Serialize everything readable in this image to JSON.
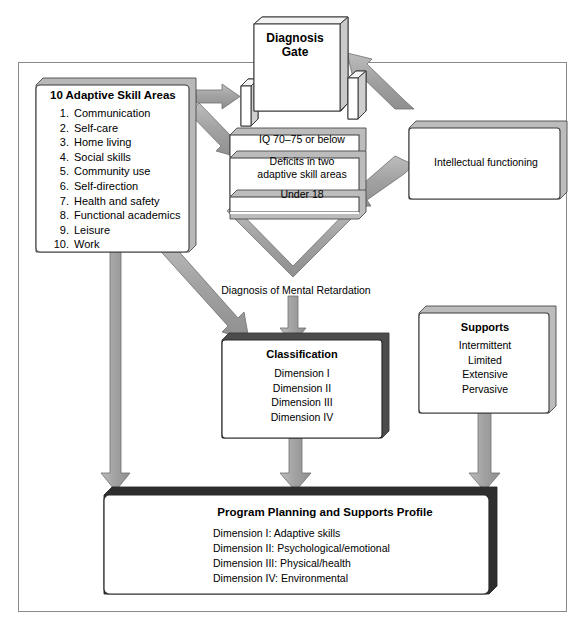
{
  "diagram": {
    "colors": {
      "arrow_fill": "#a6a6a6",
      "arrow_stroke": "#7d7d7d",
      "box_fill": "#ffffff",
      "box_stroke": "#3a3a3a",
      "shadow_fill": "#b5b5b5",
      "frame_stroke": "#8a8a8a",
      "text": "#000000"
    },
    "skill_areas": {
      "title": "10 Adaptive Skill Areas",
      "items": [
        {
          "num": "1.",
          "label": "Communication"
        },
        {
          "num": "2.",
          "label": "Self-care"
        },
        {
          "num": "3.",
          "label": "Home living"
        },
        {
          "num": "4.",
          "label": "Social skills"
        },
        {
          "num": "5.",
          "label": "Community use"
        },
        {
          "num": "6.",
          "label": "Self-direction"
        },
        {
          "num": "7.",
          "label": "Health and safety"
        },
        {
          "num": "8.",
          "label": "Functional academics"
        },
        {
          "num": "9.",
          "label": "Leisure"
        },
        {
          "num": "10.",
          "label": "Work"
        }
      ]
    },
    "gate": {
      "label_line1": "Diagnosis",
      "label_line2": "Gate"
    },
    "criteria": {
      "row1": "IQ 70–75 or below",
      "row2_line1": "Deficits in two",
      "row2_line2": "adaptive skill areas",
      "row3": "Under 18"
    },
    "intellectual_functioning": {
      "label": "Intellectual functioning"
    },
    "diagnosis_label": "Diagnosis of Mental Retardation",
    "classification": {
      "title": "Classification",
      "items": [
        "Dimension I",
        "Dimension II",
        "Dimension III",
        "Dimension IV"
      ]
    },
    "supports": {
      "title": "Supports",
      "items": [
        "Intermittent",
        "Limited",
        "Extensive",
        "Pervasive"
      ]
    },
    "program_planning": {
      "title": "Program Planning and Supports Profile",
      "items": [
        "Dimension I: Adaptive skills",
        "Dimension II: Psychological/emotional",
        "Dimension III: Physical/health",
        "Dimension IV: Environmental"
      ]
    }
  }
}
